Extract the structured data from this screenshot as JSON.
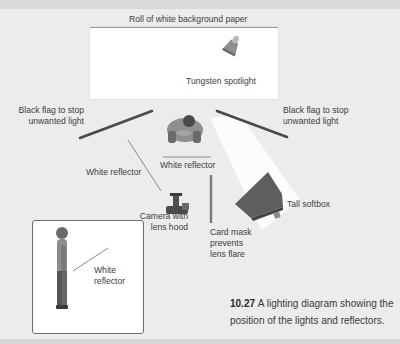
{
  "figure": {
    "labels": {
      "background_paper": "Roll of white background paper",
      "spotlight": "Tungsten spotlight",
      "flag_left": [
        "Black flag to stop",
        "unwanted light"
      ],
      "flag_right": [
        "Black flag to stop",
        "unwanted light"
      ],
      "reflector_left": "White reflector",
      "reflector_center": "White reflector",
      "camera": [
        "Camera with",
        "lens hood"
      ],
      "card_mask": [
        "Card mask",
        "prevents",
        "lens flare"
      ],
      "softbox": "Tall softbox",
      "inset_reflector": [
        "White",
        "reflector"
      ]
    },
    "caption": {
      "number": "10.27",
      "line1": "A lighting diagram showing the",
      "line2": "position of the lights and reflectors."
    },
    "icons": [
      "spotlight-icon",
      "subject-topdown-icon",
      "camera-icon",
      "softbox-icon",
      "subject-side-icon"
    ],
    "colors": {
      "background": "#ececec",
      "paper": "#ffffff",
      "flag": "#4a4a4a",
      "reflector": "#8a8a8a",
      "softbox": "#5e5e5e"
    }
  }
}
